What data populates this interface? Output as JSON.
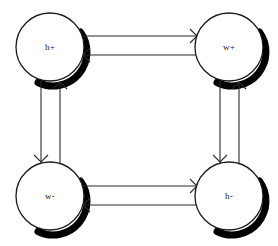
{
  "diagram": {
    "type": "state-transition-graph",
    "background_color": "#ffffff",
    "stroke_color": "#2a2a2a",
    "shadow_color": "#000000",
    "node_fill": "#ffffff",
    "nodes": [
      {
        "id": "h-plus",
        "label": "h+",
        "cx": 50,
        "cy": 47,
        "r": 34
      },
      {
        "id": "w-plus",
        "label": "w+",
        "cx": 229,
        "cy": 47,
        "r": 34
      },
      {
        "id": "w-minus",
        "label": "w-",
        "cx": 50,
        "cy": 196,
        "r": 34
      },
      {
        "id": "h-minus",
        "label": "h-",
        "cx": 229,
        "cy": 196,
        "r": 34
      }
    ],
    "edges": [
      {
        "id": "top",
        "from": "h+",
        "to": "w+",
        "orientation": "horizontal",
        "style": "bidirectional-parallel"
      },
      {
        "id": "right",
        "from": "h-",
        "to": "w+",
        "orientation": "vertical",
        "style": "bidirectional-parallel"
      },
      {
        "id": "bottom",
        "from": "w-",
        "to": "h-",
        "orientation": "horizontal",
        "style": "bidirectional-parallel"
      },
      {
        "id": "left",
        "from": "w-",
        "to": "h+",
        "orientation": "vertical",
        "style": "bidirectional-parallel"
      }
    ]
  }
}
